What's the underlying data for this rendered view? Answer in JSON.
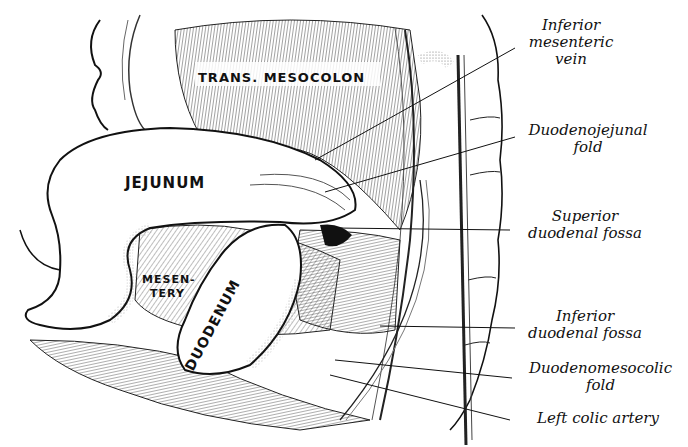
{
  "figure": {
    "type": "anatomical engraving"
  },
  "organ_labels": {
    "trans_mesocolon": "TRANS. MESOCOLON",
    "jejunum": "JEJUNUM",
    "mesentery_line1": "MESEN-",
    "mesentery_line2": "TERY",
    "duodenum": "DUODENUM"
  },
  "callouts": [
    {
      "id": "inferior-mesenteric-vein",
      "lines": [
        "Inferior",
        "mesenteric",
        "vein"
      ]
    },
    {
      "id": "duodenojejunal-fold",
      "lines": [
        "Duodenojejunal",
        "fold"
      ]
    },
    {
      "id": "superior-duodenal-fossa",
      "lines": [
        "Superior",
        "duodenal fossa"
      ]
    },
    {
      "id": "inferior-duodenal-fossa",
      "lines": [
        "Inferior",
        "duodenal fossa"
      ]
    },
    {
      "id": "duodenomesocolic-fold",
      "lines": [
        "Duodenomesocolic",
        "fold"
      ]
    },
    {
      "id": "left-colic-artery",
      "lines": [
        "Left colic artery"
      ]
    }
  ],
  "colors": {
    "ink": "#111111",
    "paper": "#ffffff",
    "hatch": "#444444"
  }
}
